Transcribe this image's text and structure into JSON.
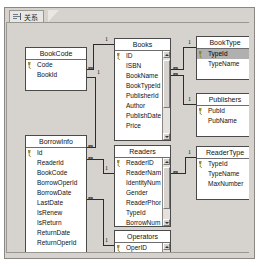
{
  "window": {
    "tab": {
      "label": "关系",
      "icon": "relationships-icon"
    }
  },
  "diagram": {
    "tables": [
      {
        "id": "bookcode",
        "title": "BookCode",
        "x": 18,
        "y": 24,
        "w": 62,
        "h": 44,
        "scrollbar": false,
        "fields": [
          {
            "name": "Code",
            "pk": true,
            "selected": false
          },
          {
            "name": "BookId",
            "pk": false,
            "selected": false
          }
        ]
      },
      {
        "id": "books",
        "title": "Books",
        "x": 107,
        "y": 15,
        "w": 57,
        "h": 103,
        "scrollbar": true,
        "scroll_thumb_top": 9,
        "scroll_thumb_height": 48,
        "fields": [
          {
            "name": "ID",
            "pk": true,
            "selected": false
          },
          {
            "name": "ISBN",
            "pk": false,
            "selected": false
          },
          {
            "name": "BookName",
            "pk": false,
            "selected": false
          },
          {
            "name": "BookTypeId",
            "pk": false,
            "selected": false
          },
          {
            "name": "PublisherId",
            "pk": false,
            "selected": false
          },
          {
            "name": "Author",
            "pk": false,
            "selected": false
          },
          {
            "name": "PublishDate",
            "pk": false,
            "selected": false
          },
          {
            "name": "Price",
            "pk": false,
            "selected": false
          }
        ]
      },
      {
        "id": "booktype",
        "title": "BookType",
        "x": 189,
        "y": 13,
        "w": 58,
        "h": 44,
        "scrollbar": false,
        "fields": [
          {
            "name": "TypeId",
            "pk": true,
            "selected": true
          },
          {
            "name": "TypeName",
            "pk": false,
            "selected": false
          }
        ]
      },
      {
        "id": "publishers",
        "title": "Publishers",
        "x": 189,
        "y": 70,
        "w": 58,
        "h": 44,
        "scrollbar": false,
        "fields": [
          {
            "name": "PubId",
            "pk": true,
            "selected": false
          },
          {
            "name": "PubName",
            "pk": false,
            "selected": false
          }
        ]
      },
      {
        "id": "readertype",
        "title": "ReaderType",
        "x": 189,
        "y": 123,
        "w": 58,
        "h": 54,
        "scrollbar": false,
        "fields": [
          {
            "name": "TypeId",
            "pk": true,
            "selected": false
          },
          {
            "name": "TypeName",
            "pk": false,
            "selected": false
          },
          {
            "name": "MaxNumber",
            "pk": false,
            "selected": false
          }
        ]
      },
      {
        "id": "borrowinfo",
        "title": "BorrowInfo",
        "x": 18,
        "y": 112,
        "w": 62,
        "h": 125,
        "scrollbar": false,
        "fields": [
          {
            "name": "Id",
            "pk": true,
            "selected": false
          },
          {
            "name": "ReaderId",
            "pk": false,
            "selected": false
          },
          {
            "name": "BookCode",
            "pk": false,
            "selected": false
          },
          {
            "name": "BorrowOperId",
            "pk": false,
            "selected": false
          },
          {
            "name": "BorrowDate",
            "pk": false,
            "selected": false
          },
          {
            "name": "LastDate",
            "pk": false,
            "selected": false
          },
          {
            "name": "IsRenew",
            "pk": false,
            "selected": false
          },
          {
            "name": "IsReturn",
            "pk": false,
            "selected": false
          },
          {
            "name": "ReturnDate",
            "pk": false,
            "selected": false
          },
          {
            "name": "ReturnOperId",
            "pk": false,
            "selected": false
          }
        ]
      },
      {
        "id": "readers",
        "title": "Readers",
        "x": 107,
        "y": 122,
        "w": 57,
        "h": 82,
        "scrollbar": true,
        "scroll_thumb_top": 9,
        "scroll_thumb_height": 42,
        "fields": [
          {
            "name": "ReaderID",
            "pk": true,
            "selected": false
          },
          {
            "name": "ReaderName",
            "pk": false,
            "selected": false
          },
          {
            "name": "IdentityNum",
            "pk": false,
            "selected": false
          },
          {
            "name": "Gender",
            "pk": false,
            "selected": false
          },
          {
            "name": "ReaderPhone",
            "pk": false,
            "selected": false
          },
          {
            "name": "TypeId",
            "pk": false,
            "selected": false
          },
          {
            "name": "BorrowNum",
            "pk": false,
            "selected": false
          },
          {
            "name": "ReaderPwd",
            "pk": false,
            "selected": false
          }
        ]
      },
      {
        "id": "operators",
        "title": "Operators",
        "x": 107,
        "y": 207,
        "w": 57,
        "h": 56,
        "scrollbar": true,
        "scroll_thumb_top": 9,
        "scroll_thumb_height": 22,
        "fields": [
          {
            "name": "OperID",
            "pk": true,
            "selected": false
          },
          {
            "name": "OperName",
            "pk": false,
            "selected": false
          },
          {
            "name": "Gender",
            "pk": false,
            "selected": false
          },
          {
            "name": "LoginName",
            "pk": false,
            "selected": false
          }
        ]
      }
    ],
    "relationships": [
      {
        "id": "bookcode-books",
        "one_label": "1",
        "many_label": "∞"
      },
      {
        "id": "books-booktype",
        "one_label": "1",
        "many_label": "∞"
      },
      {
        "id": "books-publishers",
        "one_label": "1",
        "many_label": "∞"
      },
      {
        "id": "borrowinfo-bookcode",
        "one_label": "1",
        "many_label": "∞"
      },
      {
        "id": "borrowinfo-readers",
        "one_label": "1",
        "many_label": "∞"
      },
      {
        "id": "readers-readertype",
        "one_label": "1",
        "many_label": "∞"
      },
      {
        "id": "borrowinfo-operators",
        "one_label": "1",
        "many_label": "∞"
      }
    ]
  },
  "colors": {
    "window_bg": "#d6d3ce",
    "table_bg": "#ffffff",
    "selected_row": "#b0b0b0",
    "border": "#4a4a4a",
    "key_icon": "#b8a23a"
  }
}
